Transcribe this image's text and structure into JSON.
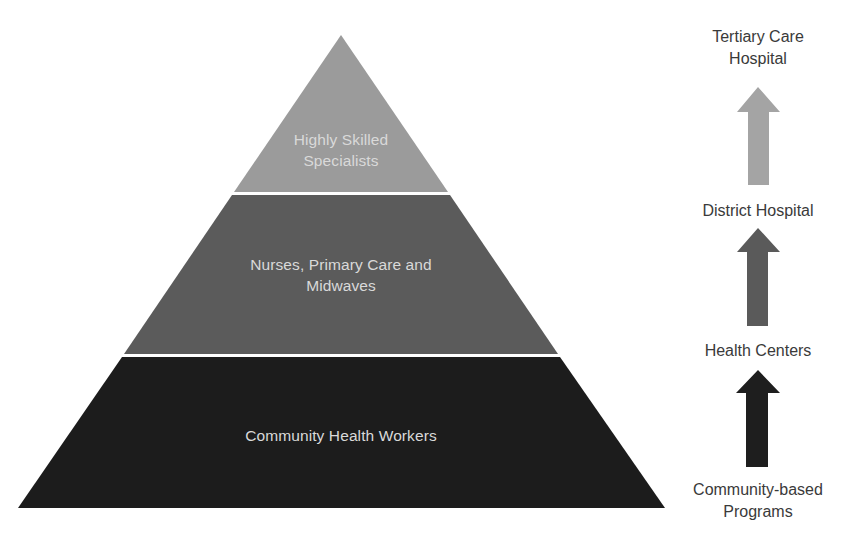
{
  "pyramid": {
    "tiers": [
      {
        "label": "Highly Skilled Specialists",
        "line1": "Highly Skilled",
        "line2": "Specialists",
        "color": "#9b9b9b"
      },
      {
        "label": "Nurses, Primary Care and Midwaves",
        "line1": "Nurses, Primary Care and",
        "line2": "Midwaves",
        "color": "#5b5b5b"
      },
      {
        "label": "Community Health Workers",
        "line1": "Community Health Workers",
        "color": "#1c1c1c"
      }
    ],
    "separator_color": "#f2f2f2"
  },
  "levels": {
    "items": [
      {
        "line1": "Tertiary Care",
        "line2": "Hospital"
      },
      {
        "line1": "District Hospital"
      },
      {
        "line1": "Health Centers"
      },
      {
        "line1": "Community-based",
        "line2": "Programs"
      }
    ],
    "arrows": [
      {
        "name": "arrow-to-tertiary",
        "color": "#a4a4a4"
      },
      {
        "name": "arrow-to-district",
        "color": "#5a5a5a"
      },
      {
        "name": "arrow-to-health-centers",
        "color": "#1e1e1e"
      }
    ]
  }
}
